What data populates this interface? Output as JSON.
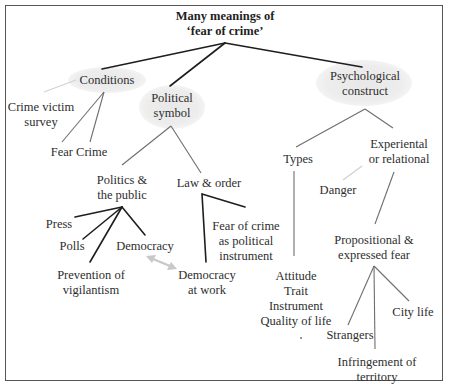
{
  "diagram": {
    "title": {
      "line1": "Many meanings of",
      "line2": "‘fear of crime’"
    },
    "branches": {
      "conditions": {
        "label": "Conditions",
        "children": {
          "crime_victim_survey": {
            "line1": "Crime victim",
            "line2": "survey"
          },
          "fear_crime": {
            "label": "Fear Crime"
          }
        }
      },
      "political_symbol": {
        "line1": "Political",
        "line2": "symbol",
        "children": {
          "politics_public": {
            "line1": "Politics &",
            "line2": "the public",
            "children": {
              "press": "Press",
              "polls": "Polls",
              "democracy": "Democracy",
              "prevention": {
                "line1": "Prevention of",
                "line2": "vigilantism"
              }
            }
          },
          "law_order": {
            "label": "Law & order",
            "children": {
              "fear_instrument": {
                "line1": "Fear of crime",
                "line2": "as political",
                "line3": "instrument"
              },
              "democracy_work": {
                "line1": "Democracy",
                "line2": "at work"
              }
            }
          }
        }
      },
      "psychological_construct": {
        "line1": "Psychological",
        "line2": "construct",
        "children": {
          "types": {
            "label": "Types",
            "children": [
              "Attitude",
              "Trait",
              "Instrument",
              "Quality of life"
            ]
          },
          "experiental": {
            "line1": "Experiental",
            "line2": "or relational",
            "children": {
              "danger": "Danger",
              "propositional": {
                "line1": "Propositional &",
                "line2": "expressed fear",
                "children": {
                  "strangers": "Strangers",
                  "city_life": "City life",
                  "infringement": {
                    "line1": "Infringement of",
                    "line2": "territory"
                  }
                }
              }
            }
          }
        }
      }
    },
    "colors": {
      "border": "#555555",
      "dark_link": "#1e1e1e",
      "mid_link": "#777777",
      "faint_link": "#cfcfcf",
      "bubble": "#e9e9e9",
      "text": "#2e2e2e"
    }
  }
}
